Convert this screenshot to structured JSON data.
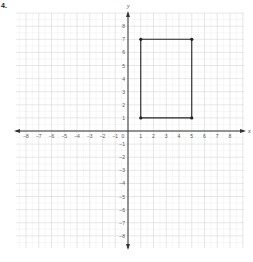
{
  "problem": {
    "number": "4."
  },
  "chart_data": {
    "type": "scatter",
    "title": "",
    "xlabel": "x",
    "ylabel": "y",
    "xlim": [
      -9,
      9
    ],
    "ylim": [
      -9,
      9
    ],
    "grid": true,
    "x_ticks": [
      -8,
      -7,
      -6,
      -5,
      -4,
      -3,
      -2,
      -1,
      0,
      1,
      2,
      3,
      4,
      5,
      6,
      7,
      8
    ],
    "y_ticks": [
      8,
      7,
      6,
      5,
      4,
      3,
      2,
      1,
      -1,
      -2,
      -3,
      -4,
      -5,
      -6,
      -7,
      -8
    ],
    "series": [
      {
        "name": "rectangle",
        "shape": "polygon",
        "closed": true,
        "points": [
          [
            1,
            1
          ],
          [
            1,
            7
          ],
          [
            5,
            7
          ],
          [
            5,
            1
          ]
        ]
      }
    ]
  },
  "style": {
    "grid_color": "#d6d6d6",
    "axis_color": "#333333",
    "shape_color": "#222222"
  }
}
